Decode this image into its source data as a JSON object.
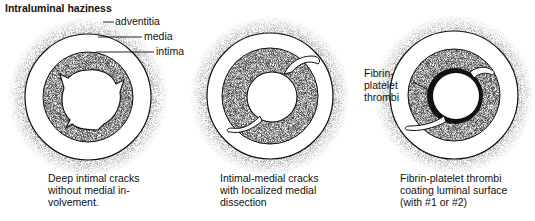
{
  "title": "Intraluminal haziness",
  "panels": [
    {
      "labels": {
        "adventitia": "adventitia",
        "media": "media",
        "intima": "intima"
      },
      "caption": "Deep intimal cracks\nwithout medial in-\nvolvement."
    },
    {
      "caption": "Intimal-medial cracks\nwith localized medial\ndissection"
    },
    {
      "labels": {
        "thrombi": "Fibrin-\nplatelet\nthrombi"
      },
      "caption": "Fibrin-platelet thrombi\ncoating luminal surface\n(with #1 or #2)"
    }
  ],
  "colors": {
    "ink": "#111111",
    "stipple": "#777777",
    "background": "#ffffff"
  },
  "figure_caption_truncated": "Fig. 11-13. ..."
}
